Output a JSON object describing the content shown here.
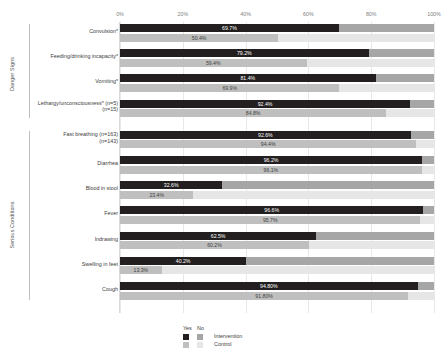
{
  "chart_data": {
    "type": "bar",
    "orientation": "horizontal",
    "stacked": true,
    "title": "",
    "xlabel": "",
    "ylabel": "",
    "xlim": [
      0,
      100
    ],
    "xticks": [
      "0%",
      "20%",
      "40%",
      "60%",
      "80%",
      "100%"
    ],
    "xtick_values": [
      0,
      20,
      40,
      60,
      80,
      100
    ],
    "grid": true,
    "legend_position": "bottom",
    "legend": {
      "col_headers": [
        "Yes",
        "No"
      ],
      "rows": [
        {
          "label": "Intervention",
          "yes_color": "#231f20",
          "no_color": "#a6a6a6"
        },
        {
          "label": "Control",
          "yes_color": "#bfbfbf",
          "no_color": "#e7e6e6"
        }
      ]
    },
    "group_axis_titles": [
      "Danger Signs",
      "Serious Conditions"
    ],
    "groups": [
      {
        "name": "Danger Signs",
        "categories": [
          {
            "label": "Convulsion*",
            "sublabel": "",
            "intervention": {
              "yes": 69.7,
              "no": 30.3,
              "label": "69.7%"
            },
            "control": {
              "yes": 50.4,
              "no": 49.6,
              "label": "50.4%"
            }
          },
          {
            "label": "Feeding/drinking incapacity*",
            "sublabel": "",
            "intervention": {
              "yes": 79.2,
              "no": 20.8,
              "label": "79.2%"
            },
            "control": {
              "yes": 59.4,
              "no": 40.6,
              "label": "59.4%"
            }
          },
          {
            "label": "Vomiting*",
            "sublabel": "",
            "intervention": {
              "yes": 81.4,
              "no": 18.6,
              "label": "81.4%"
            },
            "control": {
              "yes": 69.9,
              "no": 30.1,
              "label": "69.9%"
            }
          },
          {
            "label": "Lethargy/unconsciousness* (n=5)",
            "sublabel": "(n=15)",
            "intervention": {
              "yes": 92.4,
              "no": 7.6,
              "label": "92.4%"
            },
            "control": {
              "yes": 84.8,
              "no": 15.2,
              "label": "84.8%"
            }
          }
        ]
      },
      {
        "name": "Serious Conditions",
        "categories": [
          {
            "label": "Fast breathing (n=163)",
            "sublabel": "(n=143)",
            "intervention": {
              "yes": 92.6,
              "no": 7.4,
              "label": "92.6%"
            },
            "control": {
              "yes": 94.4,
              "no": 5.6,
              "label": "94.4%"
            }
          },
          {
            "label": "Diarrhea",
            "sublabel": "",
            "intervention": {
              "yes": 96.2,
              "no": 3.8,
              "label": "96.2%"
            },
            "control": {
              "yes": 96.1,
              "no": 3.9,
              "label": "96.1%"
            }
          },
          {
            "label": "Blood in stool",
            "sublabel": "",
            "intervention": {
              "yes": 32.6,
              "no": 67.4,
              "label": "32.6%"
            },
            "control": {
              "yes": 23.4,
              "no": 76.6,
              "label": "23.4%"
            }
          },
          {
            "label": "Fever",
            "sublabel": "",
            "intervention": {
              "yes": 96.6,
              "no": 3.4,
              "label": "96.6%"
            },
            "control": {
              "yes": 95.7,
              "no": 4.3,
              "label": "95.7%"
            }
          },
          {
            "label": "Indrawing",
            "sublabel": "",
            "intervention": {
              "yes": 62.5,
              "no": 37.5,
              "label": "62.5%"
            },
            "control": {
              "yes": 60.2,
              "no": 39.8,
              "label": "60.2%"
            }
          },
          {
            "label": "Swelling in feet",
            "sublabel": "",
            "intervention": {
              "yes": 40.2,
              "no": 59.8,
              "label": "40.2%"
            },
            "control": {
              "yes": 13.3,
              "no": 86.7,
              "label": "13.3%"
            }
          },
          {
            "label": "Cough",
            "sublabel": "",
            "intervention": {
              "yes": 94.8,
              "no": 5.2,
              "label": "94.80%"
            },
            "control": {
              "yes": 91.8,
              "no": 8.2,
              "label": "91.80%"
            }
          }
        ]
      }
    ]
  },
  "colors": {
    "intervention_yes": "#231f20",
    "intervention_no": "#a6a6a6",
    "control_yes": "#bfbfbf",
    "control_no": "#e7e6e6",
    "gridline": "#e8e8e8",
    "text": "#404040"
  }
}
